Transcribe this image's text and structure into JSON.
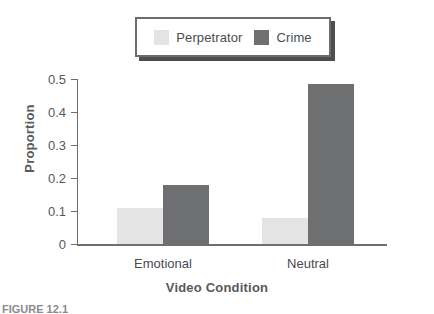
{
  "chart_data": {
    "type": "bar",
    "title": "",
    "xlabel": "Video Condition",
    "ylabel": "Proportion",
    "categories": [
      "Emotional",
      "Neutral"
    ],
    "series": [
      {
        "name": "Perpetrator",
        "values": [
          0.11,
          0.08
        ],
        "color": "#e4e4e4"
      },
      {
        "name": "Crime",
        "values": [
          0.18,
          0.485
        ],
        "color": "#6e6f71"
      }
    ],
    "ylim": [
      0,
      0.5
    ],
    "yticks": [
      0,
      0.1,
      0.2,
      0.3,
      0.4,
      0.5
    ],
    "ytick_labels": [
      "0",
      "0.1",
      "0.2",
      "0.3",
      "0.4",
      "0.5"
    ],
    "grid": false,
    "legend_position": "top-center"
  },
  "legend": {
    "entries": [
      {
        "label": "Perpetrator",
        "color": "#e4e4e4"
      },
      {
        "label": "Crime",
        "color": "#6e6f71"
      }
    ]
  },
  "axes": {
    "y_title": "Proportion",
    "x_title": "Video Condition"
  },
  "caption": {
    "fragment": "FIGURE 12.1"
  },
  "colors": {
    "perpetrator": "#e4e4e4",
    "crime": "#6e6f71",
    "axis": "#6d6e70",
    "text": "#58595b",
    "legend_border": "#6b6c6e",
    "legend_shadow": "#4d4e50",
    "background": "#ffffff"
  }
}
